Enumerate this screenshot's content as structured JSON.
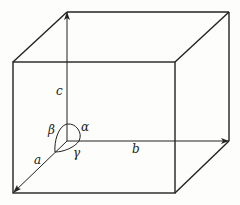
{
  "diagram": {
    "type": "unit-cell",
    "labels": {
      "edge_a": "a",
      "edge_b": "b",
      "edge_c": "c",
      "angle_alpha": "α",
      "angle_beta": "β",
      "angle_gamma": "γ"
    },
    "colors": {
      "line": "#222222",
      "background": "#fdfdfb"
    }
  }
}
